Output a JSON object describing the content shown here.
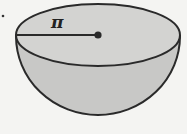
{
  "figure": {
    "type": "hemisphere",
    "radius_label": "π",
    "colors": {
      "background": "#f4f4f2",
      "fill": "#c9c9c7",
      "top_fill": "#d4d4d2",
      "stroke": "#2a2a2a"
    }
  }
}
